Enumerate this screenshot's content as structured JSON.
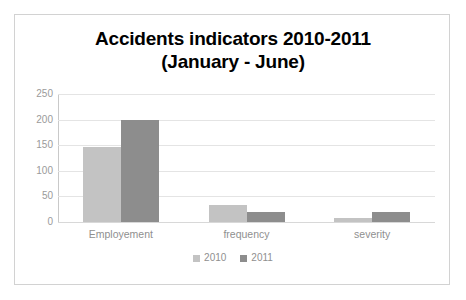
{
  "chart_data": {
    "type": "bar",
    "title": "Accidents indicators 2010-2011",
    "subtitle": "(January - June)",
    "xlabel": "",
    "ylabel": "",
    "categories": [
      "Employement",
      "frequency",
      "severity"
    ],
    "series": [
      {
        "name": "2010",
        "color": "#c3c3c3",
        "values": [
          147,
          33,
          7
        ]
      },
      {
        "name": "2011",
        "color": "#8d8d8d",
        "values": [
          200,
          20,
          20
        ]
      }
    ],
    "ylim": [
      0,
      250
    ],
    "yticks": [
      0,
      50,
      100,
      150,
      200,
      250
    ],
    "ytick_labels": [
      "0",
      "50",
      "100",
      "150",
      "200",
      "250"
    ],
    "grid": true,
    "grid_axis": "y",
    "legend": true,
    "legend_position": "bottom",
    "legend_entries": [
      "2010",
      "2011"
    ],
    "bar_mode": "grouped",
    "frame_border_color": "#d2d2d2",
    "gridline_color": "#e4e4e4",
    "tick_label_color": "#9a9a9a",
    "category_label_color": "#8f8f8f",
    "title_color": "#000000",
    "background_color": "#ffffff"
  }
}
